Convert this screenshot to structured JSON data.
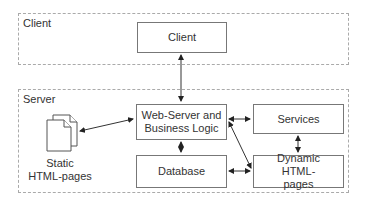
{
  "frames": {
    "client": {
      "label": "Client"
    },
    "server": {
      "label": "Server"
    }
  },
  "nodes": {
    "client": {
      "label": "Client"
    },
    "webserver": {
      "label": "Web-Server and Business Logic"
    },
    "database": {
      "label": "Database"
    },
    "services": {
      "label": "Services"
    },
    "dynamic": {
      "label": "Dynamic HTML-pages"
    },
    "static": {
      "label": "Static HTML-pages"
    }
  },
  "edges": [
    {
      "from": "client",
      "to": "webserver",
      "bidirectional": true
    },
    {
      "from": "webserver",
      "to": "static",
      "bidirectional": true
    },
    {
      "from": "webserver",
      "to": "database",
      "bidirectional": true
    },
    {
      "from": "webserver",
      "to": "services",
      "bidirectional": true
    },
    {
      "from": "webserver",
      "to": "dynamic",
      "bidirectional": true
    },
    {
      "from": "services",
      "to": "dynamic",
      "bidirectional": true
    },
    {
      "from": "database",
      "to": "dynamic",
      "bidirectional": true
    }
  ]
}
